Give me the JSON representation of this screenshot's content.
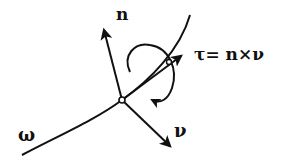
{
  "diagram": {
    "labels": {
      "normal": "n",
      "tangent_formula": "τ= n×ν",
      "curve": "ω",
      "binormal": "ν"
    },
    "colors": {
      "stroke": "#111111",
      "background": "#ffffff"
    }
  }
}
